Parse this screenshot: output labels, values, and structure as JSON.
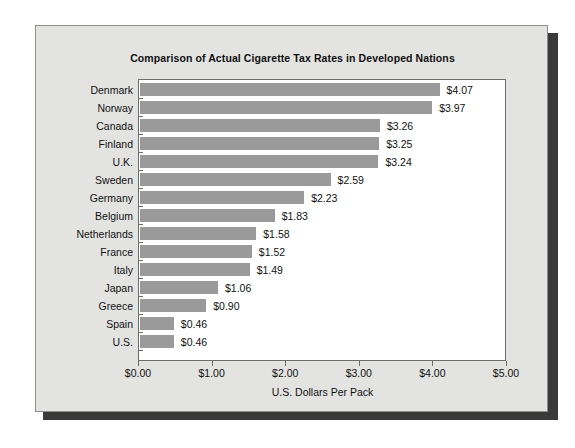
{
  "chart_data": {
    "type": "bar",
    "orientation": "horizontal",
    "title": "Comparison of Actual Cigarette Tax Rates in Developed Nations",
    "xlabel": "U.S. Dollars Per Pack",
    "ylabel": "",
    "xlim": [
      0,
      5
    ],
    "grid": false,
    "legend": "none",
    "bar_color": "#9a9a9a",
    "categories": [
      "Denmark",
      "Norway",
      "Canada",
      "Finland",
      "U.K.",
      "Sweden",
      "Germany",
      "Belgium",
      "Netherlands",
      "France",
      "Italy",
      "Japan",
      "Greece",
      "Spain",
      "U.S."
    ],
    "values": [
      4.07,
      3.97,
      3.26,
      3.25,
      3.24,
      2.59,
      2.23,
      1.83,
      1.58,
      1.52,
      1.49,
      1.06,
      0.9,
      0.46,
      0.46
    ],
    "data_labels": [
      "$4.07",
      "$3.97",
      "$3.26",
      "$3.25",
      "$3.24",
      "$2.59",
      "$2.23",
      "$1.83",
      "$1.58",
      "$1.52",
      "$1.49",
      "$1.06",
      "$0.90",
      "$0.46",
      "$0.46"
    ],
    "xticks": [
      0,
      1,
      2,
      3,
      4,
      5
    ],
    "xticklabels": [
      "$0.00",
      "$1.00",
      "$2.00",
      "$3.00",
      "$4.00",
      "$5.00"
    ]
  }
}
